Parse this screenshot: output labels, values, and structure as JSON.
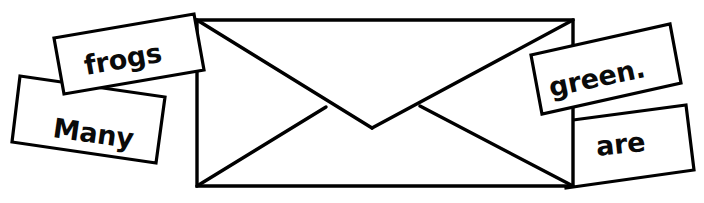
{
  "scene": {
    "title": "Envelope with scrambled sentence word cards",
    "width": 704,
    "height": 203,
    "background_color": "#ffffff",
    "ink_color": "#000000"
  },
  "envelope": {
    "name": "envelope",
    "description": "Closed envelope drawn in black outline, rear flap V pointing down",
    "fill_color": "#ffffff",
    "stroke_color": "#000000"
  },
  "sentence": {
    "assembled": "Many frogs are green.",
    "word_count": 4
  },
  "cards": [
    {
      "id": "many",
      "label": "Many",
      "position": "left-lower",
      "rotation_deg": 8,
      "z": 1
    },
    {
      "id": "frogs",
      "label": "frogs",
      "position": "left-upper",
      "rotation_deg": -10,
      "z": 2
    },
    {
      "id": "green",
      "label": "green.",
      "position": "right-upper",
      "rotation_deg": 12,
      "z": 2
    },
    {
      "id": "are",
      "label": "are",
      "position": "right-lower",
      "rotation_deg": -6,
      "z": 1
    }
  ]
}
